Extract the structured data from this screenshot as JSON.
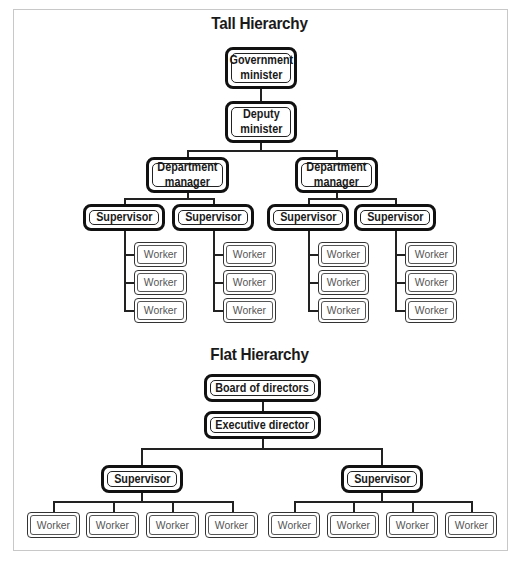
{
  "tall": {
    "title": "Tall Hierarchy",
    "minister": "Government minister",
    "minister_l1": "Government",
    "minister_l2": "minister",
    "deputy_l1": "Deputy",
    "deputy_l2": "minister",
    "dept_l1": "Department",
    "dept_l2": "manager",
    "supervisor": "Supervisor",
    "worker": "Worker"
  },
  "flat": {
    "title": "Flat Hierarchy",
    "board": "Board of directors",
    "executive": "Executive director",
    "supervisor": "Supervisor",
    "worker": "Worker"
  }
}
